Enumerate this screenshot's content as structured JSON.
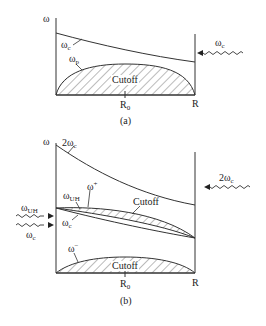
{
  "panels": [
    {
      "caption": "(a)",
      "y_axis_label": "ω",
      "x_ticks": {
        "left": "R",
        "left_sub": "0",
        "right": "R"
      },
      "curves": {
        "wc": {
          "label": "ω",
          "sub": "c"
        },
        "wp": {
          "label": "ω",
          "sub": "p"
        }
      },
      "region_label": "Cutoff",
      "incident_wave": {
        "label": "ω",
        "sub": "c",
        "direction": "from-right"
      }
    },
    {
      "caption": "(b)",
      "y_axis_label": "ω",
      "x_ticks": {
        "left": "R",
        "left_sub": "0",
        "right": "R"
      },
      "curves": {
        "two_wc": {
          "label": "2ω",
          "sub": "c"
        },
        "w_plus": {
          "label": "ω",
          "sup": "+"
        },
        "w_uh": {
          "label": "ω",
          "sub": "UH"
        },
        "wc": {
          "label": "ω",
          "sub": "c"
        },
        "w_minus": {
          "label": "ω",
          "sup": "−"
        }
      },
      "region_labels": [
        "Cutoff",
        "Cutoff"
      ],
      "incident_waves": [
        {
          "label": "2ω",
          "sub": "c",
          "direction": "from-right"
        },
        {
          "label": "ω",
          "sub": "UH",
          "direction": "from-left"
        },
        {
          "label": "ω",
          "sub": "c",
          "direction": "from-left"
        }
      ]
    }
  ],
  "colors": {
    "line": "#333333",
    "hatch": "#555555",
    "background": "#ffffff"
  }
}
